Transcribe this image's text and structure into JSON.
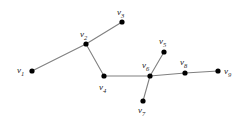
{
  "figure": {
    "type": "undirected-graph-diagram",
    "background_color": "#ffffff",
    "edge_color": "#808080",
    "vertex_color": "#000000",
    "label_color": "#1a1a1a",
    "width": 247,
    "height": 122
  },
  "vertices": [
    {
      "id": "v1",
      "label_v": "v",
      "label_sub": "1",
      "x": 32,
      "y": 71,
      "r": 2.6,
      "label_x": 17,
      "label_y": 66
    },
    {
      "id": "v2",
      "label_v": "v",
      "label_sub": "2",
      "x": 86,
      "y": 44,
      "r": 2.6,
      "label_x": 80,
      "label_y": 30
    },
    {
      "id": "v3",
      "label_v": "v",
      "label_sub": "3",
      "x": 122,
      "y": 22,
      "r": 2.6,
      "label_x": 117,
      "label_y": 8
    },
    {
      "id": "v4",
      "label_v": "v",
      "label_sub": "4",
      "x": 104,
      "y": 76,
      "r": 2.6,
      "label_x": 99,
      "label_y": 83
    },
    {
      "id": "v5",
      "label_v": "v",
      "label_sub": "5",
      "x": 164,
      "y": 52,
      "r": 2.6,
      "label_x": 159,
      "label_y": 37
    },
    {
      "id": "v6",
      "label_v": "v",
      "label_sub": "6",
      "x": 150,
      "y": 76,
      "r": 2.6,
      "label_x": 142,
      "label_y": 61
    },
    {
      "id": "v7",
      "label_v": "v",
      "label_sub": "7",
      "x": 143,
      "y": 101,
      "r": 2.6,
      "label_x": 138,
      "label_y": 106
    },
    {
      "id": "v8",
      "label_v": "v",
      "label_sub": "8",
      "x": 185,
      "y": 73,
      "r": 2.6,
      "label_x": 180,
      "label_y": 58
    },
    {
      "id": "v9",
      "label_v": "v",
      "label_sub": "9",
      "x": 218,
      "y": 71,
      "r": 2.6,
      "label_x": 224,
      "label_y": 67
    }
  ],
  "edges": [
    {
      "id": "e-v1-v2",
      "from": "v1",
      "to": "v2",
      "x1": 32,
      "y1": 71,
      "x2": 86,
      "y2": 44
    },
    {
      "id": "e-v2-v3",
      "from": "v2",
      "to": "v3",
      "x1": 86,
      "y1": 44,
      "x2": 122,
      "y2": 22
    },
    {
      "id": "e-v2-v4",
      "from": "v2",
      "to": "v4",
      "x1": 86,
      "y1": 44,
      "x2": 104,
      "y2": 76
    },
    {
      "id": "e-v4-v6",
      "from": "v4",
      "to": "v6",
      "x1": 104,
      "y1": 76,
      "x2": 150,
      "y2": 76
    },
    {
      "id": "e-v6-v5",
      "from": "v6",
      "to": "v5",
      "x1": 150,
      "y1": 76,
      "x2": 164,
      "y2": 52
    },
    {
      "id": "e-v6-v7",
      "from": "v6",
      "to": "v7",
      "x1": 150,
      "y1": 76,
      "x2": 143,
      "y2": 101
    },
    {
      "id": "e-v6-v8",
      "from": "v6",
      "to": "v8",
      "x1": 150,
      "y1": 76,
      "x2": 185,
      "y2": 73
    },
    {
      "id": "e-v8-v9",
      "from": "v8",
      "to": "v9",
      "x1": 185,
      "y1": 73,
      "x2": 218,
      "y2": 71
    }
  ]
}
